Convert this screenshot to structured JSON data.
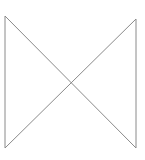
{
  "diagram": {
    "shape": "bowtie",
    "stroke_color": "#8a8a8a",
    "background": "#ffffff",
    "points": {
      "top_left": [
        5,
        16
      ],
      "top_right": [
        136,
        19
      ],
      "bottom_left": [
        5,
        148
      ],
      "bottom_right": [
        136,
        148
      ]
    }
  }
}
